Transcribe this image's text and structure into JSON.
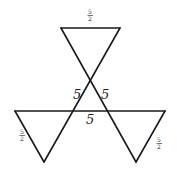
{
  "diagram": {
    "type": "geometric-figure",
    "labels": {
      "left_side": "5",
      "right_side": "5",
      "bottom_side": "5",
      "top_small": "5/2",
      "left_small": "5/2",
      "right_small": "5/2"
    },
    "frac": {
      "num": "5",
      "den": "2"
    },
    "colors": {
      "stroke": "#1a1a1a",
      "background": "#ffffff"
    }
  }
}
